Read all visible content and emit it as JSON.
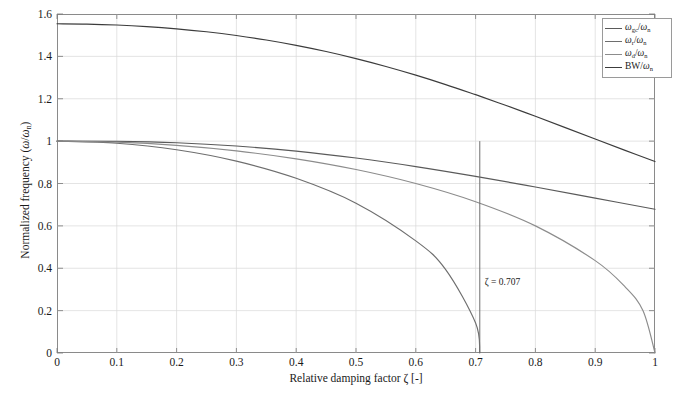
{
  "chart_data": {
    "type": "line",
    "title": "",
    "xlabel": "Relative damping factor ζ [-]",
    "ylabel": "Normalized frequency (ω/ωn)",
    "xlim": [
      0,
      1
    ],
    "ylim": [
      0,
      1.6
    ],
    "xticks": [
      0,
      0.1,
      0.2,
      0.3,
      0.4,
      0.5,
      0.6,
      0.7,
      0.8,
      0.9,
      1
    ],
    "xtick_labels": [
      "0",
      "0.1",
      "0.2",
      "0.3",
      "0.4",
      "0.5",
      "0.6",
      "0.7",
      "0.8",
      "0.9",
      "1"
    ],
    "yticks": [
      0,
      0.2,
      0.4,
      0.6,
      0.8,
      1,
      1.2,
      1.4,
      1.6
    ],
    "ytick_labels": [
      "0",
      "0.2",
      "0.4",
      "0.6",
      "0.8",
      "1",
      "1.2",
      "1.4",
      "1.6"
    ],
    "grid": true,
    "legend_position": "top-right",
    "series": [
      {
        "name": "BW/ωn",
        "legend_label": "BW/ωn",
        "color": "#3c3c3c",
        "x": [
          0,
          0.05,
          0.1,
          0.15,
          0.2,
          0.25,
          0.3,
          0.35,
          0.4,
          0.45,
          0.5,
          0.55,
          0.6,
          0.65,
          0.7,
          0.707,
          0.75,
          0.8,
          0.85,
          0.9,
          0.95,
          1
        ],
        "values": [
          1.5538,
          1.5524,
          1.548,
          1.5406,
          1.53,
          1.516,
          1.4985,
          1.4772,
          1.452,
          1.4228,
          1.3896,
          1.3524,
          1.3114,
          1.2669,
          1.2193,
          1.2125,
          1.1692,
          1.1171,
          1.0638,
          1.01,
          0.9564,
          0.9036
        ],
        "tail_x": [
          1
        ],
        "tail_values": [
          0.6436
        ]
      },
      {
        "name": "ωgc/ωn",
        "legend_label": "ωgc/ωn",
        "color": "#5a5a5a",
        "x": [
          0,
          0.1,
          0.2,
          0.3,
          0.4,
          0.5,
          0.6,
          0.7,
          0.8,
          0.9,
          1
        ],
        "values": [
          1.0,
          0.999,
          0.9923,
          0.977,
          0.953,
          0.9202,
          0.8799,
          0.8337,
          0.7836,
          0.7313,
          0.6783
        ]
      },
      {
        "name": "ωr/ωn",
        "legend_label": "ωr/ωn",
        "color": "#6e6e6e",
        "x": [
          0,
          0.1,
          0.2,
          0.3,
          0.4,
          0.5,
          0.6,
          0.65,
          0.7,
          0.707
        ],
        "values": [
          1.0,
          0.9899,
          0.9592,
          0.9055,
          0.8246,
          0.7071,
          0.5292,
          0.3937,
          0.1414,
          0.0
        ]
      },
      {
        "name": "ωd/ωn",
        "legend_label": "ωd/ωn",
        "color": "#8c8c8c",
        "x": [
          0,
          0.1,
          0.2,
          0.3,
          0.4,
          0.5,
          0.6,
          0.7,
          0.8,
          0.9,
          0.95,
          0.98,
          1
        ],
        "values": [
          1.0,
          0.995,
          0.9798,
          0.9539,
          0.9165,
          0.866,
          0.8,
          0.7141,
          0.6,
          0.4359,
          0.3122,
          0.199,
          0.0
        ]
      }
    ],
    "annotations": [
      {
        "text": "ζ = 0.707",
        "x": 0.707,
        "y": 0.33,
        "marker": "vertical-line",
        "marker_x": 0.707,
        "marker_y_top": 1.0,
        "marker_y_bottom": 0.0,
        "color": "#6e6e6e"
      }
    ]
  },
  "axis": {
    "ylabel_prefix": "Normalized frequency (",
    "ylabel_omega": "ω",
    "ylabel_slash": "/",
    "ylabel_omega_n": "ω",
    "ylabel_sub_n": "n",
    "ylabel_suffix": ")",
    "xlabel_prefix": "Relative damping factor ",
    "xlabel_zeta": "ζ",
    "xlabel_suffix": " [-]"
  },
  "legend": {
    "items": [
      {
        "symbol": "ω",
        "sub": "gc",
        "den": "ω",
        "den_sub": "n",
        "color": "#5a5a5a",
        "plain": "ωgc/ωn"
      },
      {
        "symbol": "ω",
        "sub": "r",
        "den": "ω",
        "den_sub": "n",
        "color": "#6e6e6e",
        "plain": "ωr/ωn"
      },
      {
        "symbol": "ω",
        "sub": "d",
        "den": "ω",
        "den_sub": "n",
        "color": "#8c8c8c",
        "plain": "ωd/ωn"
      },
      {
        "symbol": "BW",
        "sub": "",
        "den": "ω",
        "den_sub": "n",
        "color": "#3c3c3c",
        "plain": "BW/ωn"
      }
    ]
  },
  "annotation_text": "ζ = 0.707"
}
